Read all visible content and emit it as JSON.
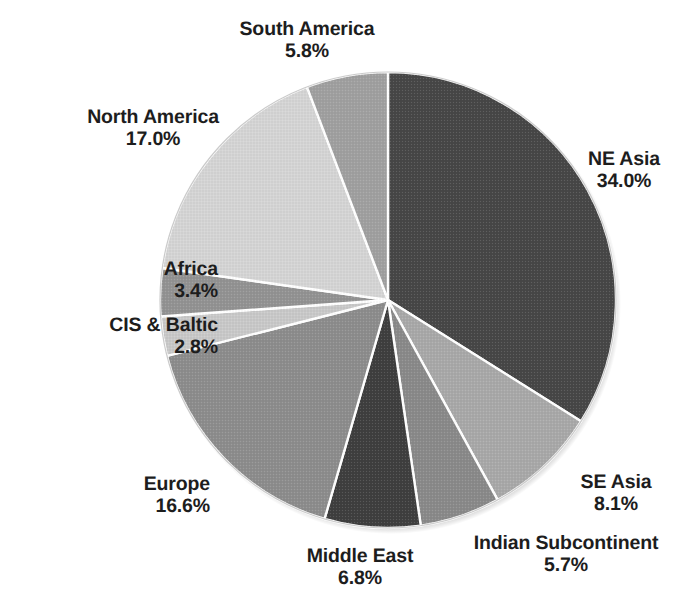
{
  "chart_data": {
    "type": "pie",
    "title": "",
    "subtitle": "",
    "xlabel": "",
    "ylabel": "",
    "legend_position": "none",
    "grid": false,
    "units": "percent",
    "start_angle_deg": 0,
    "direction": "clockwise",
    "total": 100.2,
    "categories": [
      "NE Asia",
      "SE Asia",
      "Indian Subcontinent",
      "Middle East",
      "Europe",
      "CIS & Baltic",
      "Africa",
      "North America",
      "South America"
    ],
    "values": [
      34.0,
      8.1,
      5.7,
      6.8,
      16.6,
      2.8,
      3.4,
      17.0,
      5.8
    ],
    "value_labels": [
      "34.0%",
      "8.1%",
      "5.7%",
      "6.8%",
      "16.6%",
      "2.8%",
      "3.4%",
      "17.0%",
      "5.8%"
    ],
    "colors": [
      "#474747",
      "#a9a9a9",
      "#8a8a8a",
      "#3f3f3f",
      "#8d8d8d",
      "#c9c9c9",
      "#939393",
      "#d5d5d5",
      "#a0a0a0"
    ],
    "slices": [
      {
        "name": "NE Asia",
        "value": 34.0,
        "value_label": "34.0%",
        "color": "#474747"
      },
      {
        "name": "SE Asia",
        "value": 8.1,
        "value_label": "8.1%",
        "color": "#a9a9a9"
      },
      {
        "name": "Indian Subcontinent",
        "value": 5.7,
        "value_label": "5.7%",
        "color": "#8a8a8a"
      },
      {
        "name": "Middle East",
        "value": 6.8,
        "value_label": "6.8%",
        "color": "#3f3f3f"
      },
      {
        "name": "Europe",
        "value": 16.6,
        "value_label": "16.6%",
        "color": "#8d8d8d"
      },
      {
        "name": "CIS & Baltic",
        "value": 2.8,
        "value_label": "2.8%",
        "color": "#c9c9c9"
      },
      {
        "name": "Africa",
        "value": 3.4,
        "value_label": "3.4%",
        "color": "#939393"
      },
      {
        "name": "North America",
        "value": 17.0,
        "value_label": "17.0%",
        "color": "#d5d5d5"
      },
      {
        "name": "South America",
        "value": 5.8,
        "value_label": "5.8%",
        "color": "#a0a0a0"
      }
    ]
  },
  "labels": {
    "ne_asia": {
      "name": "NE Asia",
      "value": "34.0%"
    },
    "se_asia": {
      "name": "SE Asia",
      "value": "8.1%"
    },
    "indian_sub": {
      "name": "Indian Subcontinent",
      "value": "5.7%"
    },
    "middle_east": {
      "name": "Middle East",
      "value": "6.8%"
    },
    "europe": {
      "name": "Europe",
      "value": "16.6%"
    },
    "cis_baltic": {
      "name": "CIS & Baltic",
      "value": "2.8%"
    },
    "africa": {
      "name": "Africa",
      "value": "3.4%"
    },
    "north_america": {
      "name": "North America",
      "value": "17.0%"
    },
    "south_america": {
      "name": "South America",
      "value": "5.8%"
    }
  },
  "style": {
    "background": "#ffffff",
    "text_color": "#1d1d1d",
    "slice_border": "#ffffff"
  }
}
